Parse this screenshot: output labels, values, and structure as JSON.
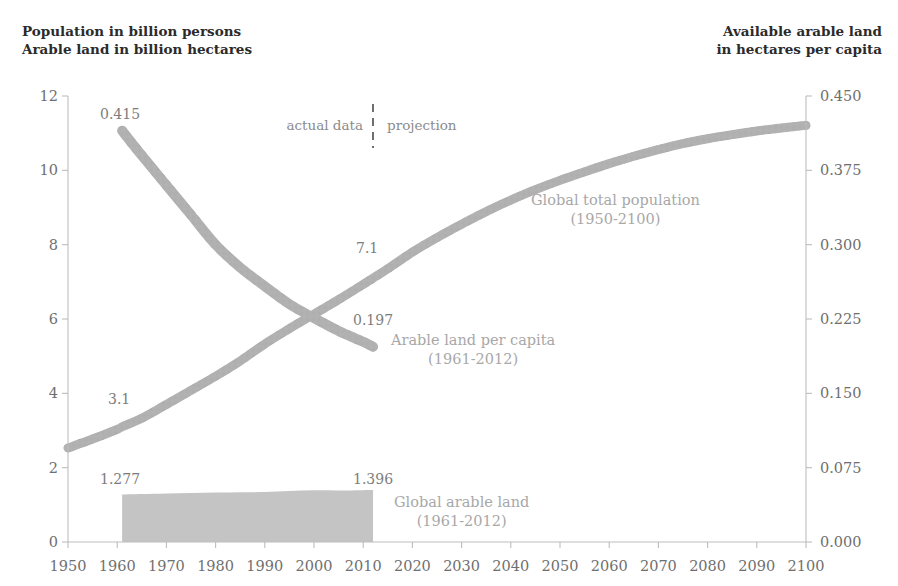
{
  "header": {
    "left_line1": "Population in billion persons",
    "left_line2": "Arable land in billion hectares",
    "right_line1": "Available arable land",
    "right_line2": "in hectares per capita"
  },
  "annotations": {
    "actual_data": "actual data",
    "projection": "projection"
  },
  "series_labels": {
    "population_line1": "Global total population",
    "population_line2": "(1950-2100)",
    "per_capita_line1": "Arable land per capita",
    "per_capita_line2": "(1961-2012)",
    "arable_line1": "Global arable land",
    "arable_line2": "(1961-2012)"
  },
  "value_labels": {
    "per_capita_start": "0.415",
    "per_capita_end": "0.197",
    "population_1961": "3.1",
    "population_2012": "7.1",
    "arable_start": "1.277",
    "arable_end": "1.396"
  },
  "colors": {
    "series_gray": "#b0b0b0",
    "area_gray": "#c4c4c4",
    "axis_gray": "#bdbdbd",
    "text_gray": "#6f6f6f",
    "title_color": "#2b2b2b"
  },
  "chart_data": {
    "type": "line",
    "title": "",
    "xlabel": "",
    "ylabel": "Population in billion persons / Arable land in billion hectares",
    "y2label": "Available arable land in hectares per capita",
    "grid": false,
    "legend": "inline-annotations",
    "xlim": [
      1950,
      2100
    ],
    "ylim": [
      0,
      12
    ],
    "y2lim": [
      0.0,
      0.45
    ],
    "xticks": [
      1950,
      1960,
      1970,
      1980,
      1990,
      2000,
      2010,
      2020,
      2030,
      2040,
      2050,
      2060,
      2070,
      2080,
      2090,
      2100
    ],
    "yticks": [
      0,
      2,
      4,
      6,
      8,
      10,
      12
    ],
    "y2ticks": [
      "0.000",
      "0.075",
      "0.150",
      "0.225",
      "0.300",
      "0.375",
      "0.450"
    ],
    "divider_year": 2012,
    "divider_note_left": "actual data",
    "divider_note_right": "projection",
    "series": [
      {
        "name": "Global total population",
        "units": "billion persons",
        "axis": "left",
        "range": "1950-2100",
        "x": [
          1950,
          1955,
          1960,
          1961,
          1965,
          1970,
          1975,
          1980,
          1985,
          1990,
          1995,
          2000,
          2005,
          2010,
          2012,
          2015,
          2020,
          2025,
          2030,
          2035,
          2040,
          2045,
          2050,
          2055,
          2060,
          2065,
          2070,
          2075,
          2080,
          2085,
          2090,
          2095,
          2100
        ],
        "values": [
          2.53,
          2.77,
          3.03,
          3.1,
          3.33,
          3.7,
          4.08,
          4.46,
          4.87,
          5.33,
          5.74,
          6.13,
          6.52,
          6.93,
          7.1,
          7.35,
          7.8,
          8.19,
          8.55,
          8.89,
          9.2,
          9.48,
          9.73,
          9.96,
          10.18,
          10.38,
          10.56,
          10.72,
          10.85,
          10.96,
          11.06,
          11.14,
          11.21
        ],
        "labeled_points": [
          {
            "year": 1961,
            "label": "3.1"
          },
          {
            "year": 2012,
            "label": "7.1"
          }
        ]
      },
      {
        "name": "Arable land per capita",
        "units": "hectares per capita",
        "axis": "right",
        "range": "1961-2012",
        "x": [
          1961,
          1965,
          1970,
          1975,
          1980,
          1985,
          1990,
          1995,
          2000,
          2005,
          2010,
          2012
        ],
        "values": [
          0.415,
          0.39,
          0.36,
          0.33,
          0.3,
          0.277,
          0.258,
          0.24,
          0.226,
          0.213,
          0.202,
          0.197
        ],
        "labeled_points": [
          {
            "year": 1961,
            "label": "0.415"
          },
          {
            "year": 2012,
            "label": "0.197"
          }
        ]
      },
      {
        "name": "Global arable land",
        "units": "billion hectares",
        "axis": "left",
        "type": "area",
        "range": "1961-2012",
        "x": [
          1961,
          1965,
          1970,
          1975,
          1980,
          1985,
          1990,
          1995,
          2000,
          2005,
          2010,
          2012
        ],
        "values": [
          1.277,
          1.29,
          1.305,
          1.32,
          1.33,
          1.338,
          1.345,
          1.37,
          1.39,
          1.385,
          1.392,
          1.396
        ],
        "labeled_points": [
          {
            "year": 1961,
            "label": "1.277"
          },
          {
            "year": 2012,
            "label": "1.396"
          }
        ]
      }
    ]
  }
}
